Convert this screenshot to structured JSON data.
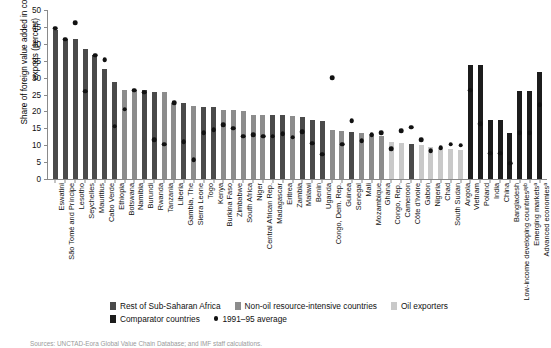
{
  "axis": {
    "ylabel": "Share of foreign value added in countries' exports (percent)",
    "yticks": [
      "0",
      "5",
      "10",
      "15",
      "20",
      "25",
      "30",
      "35",
      "40",
      "45",
      "50"
    ]
  },
  "legend": {
    "items": [
      {
        "label": "Rest of Sub-Saharan Africa",
        "marker": "square",
        "color": "#4a4a4a"
      },
      {
        "label": "Non-oil resource-intensive countries",
        "marker": "square",
        "color": "#8c8c8c"
      },
      {
        "label": "Oil exporters",
        "marker": "square",
        "color": "#c9c9c9"
      },
      {
        "label": "Comparator countries",
        "marker": "square",
        "color": "#1c1c1c"
      },
      {
        "label": "1991–95 average",
        "marker": "dot",
        "color": "#111111"
      }
    ]
  },
  "source": {
    "text": "Sources: UNCTAD-Eora Global Value Chain Database; and IMF staff calculations."
  },
  "colors": {
    "rest_ssa": "#4a4a4a",
    "non_oil_resource": "#8c8c8c",
    "oil_exporters": "#c9c9c9",
    "comparators": "#1c1c1c",
    "dot": "#111111",
    "axis": "#8a8a8a"
  },
  "chart_data": {
    "type": "bar",
    "title": "",
    "xlabel": "",
    "ylabel": "Share of foreign value added in countries' exports (percent)",
    "ylim": [
      0,
      50
    ],
    "ytick_step": 5,
    "grid": false,
    "legend_position": "bottom",
    "series": [
      {
        "name": "2015 foreign value added share",
        "type": "bar"
      },
      {
        "name": "1991–95 average",
        "type": "point-overlay"
      }
    ],
    "categories": [
      "Eswatini",
      "São Tomé and Príncipe",
      "Lesotho",
      "Seychelles",
      "Mauritius",
      "Cabo Verde",
      "Ethiopia",
      "Botswana",
      "Namibia",
      "Burundi",
      "Rwanda",
      "Tanzania",
      "Liberia",
      "Gambia, The",
      "Sierra Leone",
      "Togo",
      "Kenya",
      "Burkina Faso",
      "Zimbabwe",
      "South Africa",
      "Niger",
      "Central African Rep.",
      "Madagascar",
      "Eritrea",
      "Zambia",
      "Malawi",
      "Benin",
      "Uganda",
      "Congo, Dem. Rep.",
      "Guinea",
      "Senegal",
      "Mali",
      "Mozambique",
      "Ghana",
      "Congo, Rep.",
      "Cameroon",
      "Côte d'Ivoire",
      "Gabon",
      "Nigeria",
      "Chad",
      "South Sudan",
      "Angola",
      "Vietnam",
      "Poland",
      "India",
      "China",
      "Bangladesh",
      "Low-income developing countriesᵃʸᵇ",
      "Emerging marketsᵃ",
      "Advanced economiesᵃ"
    ],
    "values": [
      44.0,
      41.3,
      41.3,
      38.6,
      36.6,
      32.6,
      28.6,
      26.3,
      26.3,
      26.3,
      25.6,
      25.6,
      22.6,
      22.6,
      21.6,
      21.3,
      21.3,
      20.3,
      20.3,
      20.0,
      19.0,
      19.0,
      19.0,
      19.0,
      18.6,
      18.3,
      17.6,
      17.3,
      14.6,
      14.3,
      14.0,
      13.6,
      13.3,
      12.6,
      11.0,
      10.6,
      10.3,
      10.0,
      9.6,
      9.3,
      9.0,
      8.6,
      33.6,
      33.6,
      17.6,
      17.6,
      13.6,
      26.0,
      26.0,
      31.6
    ],
    "group_of_value": [
      "rest_ssa",
      "rest_ssa",
      "rest_ssa",
      "rest_ssa",
      "rest_ssa",
      "rest_ssa",
      "rest_ssa",
      "non_oil_resource",
      "non_oil_resource",
      "rest_ssa",
      "rest_ssa",
      "non_oil_resource",
      "non_oil_resource",
      "rest_ssa",
      "non_oil_resource",
      "rest_ssa",
      "rest_ssa",
      "non_oil_resource",
      "non_oil_resource",
      "non_oil_resource",
      "non_oil_resource",
      "non_oil_resource",
      "rest_ssa",
      "rest_ssa",
      "non_oil_resource",
      "rest_ssa",
      "rest_ssa",
      "rest_ssa",
      "non_oil_resource",
      "non_oil_resource",
      "rest_ssa",
      "non_oil_resource",
      "non_oil_resource",
      "non_oil_resource",
      "oil_exporters",
      "oil_exporters",
      "rest_ssa",
      "oil_exporters",
      "oil_exporters",
      "oil_exporters",
      "oil_exporters",
      "oil_exporters",
      "comparators",
      "comparators",
      "comparators",
      "comparators",
      "comparators",
      "comparators",
      "comparators",
      "comparators"
    ],
    "average_1991_95": [
      44.6,
      41.3,
      46.3,
      26.0,
      36.6,
      35.3,
      15.6,
      20.6,
      26.3,
      25.6,
      11.6,
      10.3,
      22.6,
      11.0,
      5.6,
      13.6,
      14.6,
      16.0,
      15.0,
      12.6,
      13.0,
      12.6,
      12.6,
      13.3,
      12.3,
      14.0,
      10.6,
      7.3,
      30.0,
      10.3,
      17.3,
      11.3,
      13.0,
      13.6,
      9.0,
      14.3,
      15.3,
      11.6,
      8.3,
      9.3,
      10.3,
      10.0,
      26.3,
      16.3,
      7.6,
      7.6,
      4.6,
      13.6,
      13.6,
      22.0
    ]
  }
}
